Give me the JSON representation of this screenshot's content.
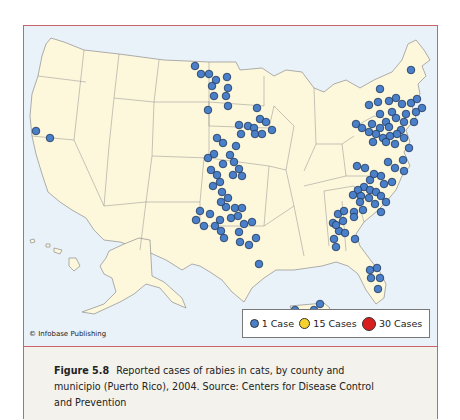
{
  "figure": {
    "label": "Figure 5.8",
    "caption": "Reported cases of rabies in cats, by county and municipio (Puerto Rico), 2004. Source: Centers for Disease Control and Prevention",
    "caption_lines": [
      "Reported cases of rabies in cats, by county and",
      "municipio (Puerto Rico), 2004. Source: Centers for Disease Con-",
      "trol and Prevention"
    ]
  },
  "map": {
    "region": "United States (incl. Alaska, Hawaii, Puerto Rico)",
    "copyright": "© Infobase Publishing",
    "colors": {
      "land": "#fdf8dc",
      "water": "#eaf2f9",
      "border": "#8c8c8c",
      "frame": "#c9646c",
      "dot_1": "#4a7fc9",
      "dot_15": "#f5d22e",
      "dot_30": "#d81e1e"
    }
  },
  "legend": {
    "items": [
      {
        "label": "1 Case",
        "color": "#4a7fc9",
        "size": 9
      },
      {
        "label": "15 Cases",
        "color": "#f5d22e",
        "size": 11
      },
      {
        "label": "30 Cases",
        "color": "#d81e1e",
        "size": 14
      }
    ]
  },
  "chart_data": {
    "type": "scatter",
    "title": "Reported cases of rabies in cats, by county and municipio (Puerto Rico), 2004",
    "legend": [
      "1 Case",
      "15 Cases",
      "30 Cases"
    ],
    "note": "All plotted points are 1-case markers; approximate pixel positions within the map panel",
    "points": [
      [
        12,
        105
      ],
      [
        26,
        112
      ],
      [
        171,
        40
      ],
      [
        177,
        48
      ],
      [
        185,
        48
      ],
      [
        192,
        54
      ],
      [
        203,
        51
      ],
      [
        188,
        60
      ],
      [
        204,
        62
      ],
      [
        190,
        70
      ],
      [
        202,
        70
      ],
      [
        204,
        80
      ],
      [
        184,
        84
      ],
      [
        233,
        82
      ],
      [
        236,
        93
      ],
      [
        242,
        96
      ],
      [
        248,
        104
      ],
      [
        215,
        99
      ],
      [
        224,
        100
      ],
      [
        230,
        102
      ],
      [
        217,
        108
      ],
      [
        231,
        108
      ],
      [
        238,
        108
      ],
      [
        193,
        112
      ],
      [
        199,
        117
      ],
      [
        190,
        128
      ],
      [
        212,
        120
      ],
      [
        210,
        136
      ],
      [
        206,
        129
      ],
      [
        199,
        138
      ],
      [
        184,
        132
      ],
      [
        187,
        144
      ],
      [
        193,
        149
      ],
      [
        196,
        156
      ],
      [
        209,
        149
      ],
      [
        215,
        143
      ],
      [
        218,
        150
      ],
      [
        189,
        160
      ],
      [
        198,
        166
      ],
      [
        204,
        172
      ],
      [
        211,
        182
      ],
      [
        202,
        181
      ],
      [
        197,
        176
      ],
      [
        172,
        194
      ],
      [
        176,
        185
      ],
      [
        180,
        200
      ],
      [
        186,
        188
      ],
      [
        196,
        194
      ],
      [
        191,
        200
      ],
      [
        197,
        205
      ],
      [
        200,
        212
      ],
      [
        207,
        192
      ],
      [
        214,
        190
      ],
      [
        220,
        198
      ],
      [
        228,
        196
      ],
      [
        215,
        206
      ],
      [
        216,
        216
      ],
      [
        225,
        219
      ],
      [
        232,
        212
      ],
      [
        218,
        182
      ],
      [
        235,
        238
      ],
      [
        387,
        44
      ],
      [
        356,
        63
      ],
      [
        345,
        79
      ],
      [
        354,
        76
      ],
      [
        365,
        75
      ],
      [
        372,
        72
      ],
      [
        378,
        78
      ],
      [
        387,
        77
      ],
      [
        393,
        73
      ],
      [
        392,
        86
      ],
      [
        398,
        82
      ],
      [
        382,
        88
      ],
      [
        368,
        86
      ],
      [
        356,
        88
      ],
      [
        362,
        96
      ],
      [
        372,
        92
      ],
      [
        380,
        96
      ],
      [
        390,
        96
      ],
      [
        377,
        104
      ],
      [
        365,
        101
      ],
      [
        356,
        102
      ],
      [
        348,
        98
      ],
      [
        332,
        98
      ],
      [
        338,
        102
      ],
      [
        345,
        106
      ],
      [
        352,
        108
      ],
      [
        359,
        112
      ],
      [
        366,
        110
      ],
      [
        373,
        108
      ],
      [
        380,
        112
      ],
      [
        371,
        118
      ],
      [
        362,
        116
      ],
      [
        349,
        116
      ],
      [
        385,
        122
      ],
      [
        379,
        134
      ],
      [
        364,
        136
      ],
      [
        371,
        142
      ],
      [
        380,
        145
      ],
      [
        357,
        150
      ],
      [
        346,
        154
      ],
      [
        360,
        158
      ],
      [
        368,
        156
      ],
      [
        333,
        140
      ],
      [
        341,
        142
      ],
      [
        350,
        148
      ],
      [
        340,
        161
      ],
      [
        346,
        164
      ],
      [
        352,
        166
      ],
      [
        357,
        170
      ],
      [
        334,
        164
      ],
      [
        329,
        169
      ],
      [
        337,
        170
      ],
      [
        345,
        172
      ],
      [
        351,
        178
      ],
      [
        362,
        176
      ],
      [
        357,
        186
      ],
      [
        339,
        184
      ],
      [
        330,
        186
      ],
      [
        336,
        176
      ],
      [
        314,
        188
      ],
      [
        320,
        185
      ],
      [
        330,
        191
      ],
      [
        319,
        195
      ],
      [
        309,
        197
      ],
      [
        315,
        205
      ],
      [
        312,
        199
      ],
      [
        321,
        207
      ],
      [
        331,
        213
      ],
      [
        310,
        213
      ],
      [
        312,
        221
      ],
      [
        346,
        244
      ],
      [
        353,
        242
      ],
      [
        347,
        252
      ],
      [
        356,
        252
      ],
      [
        354,
        263
      ],
      [
        271,
        284
      ],
      [
        282,
        288
      ],
      [
        290,
        284
      ],
      [
        296,
        278
      ]
    ]
  }
}
